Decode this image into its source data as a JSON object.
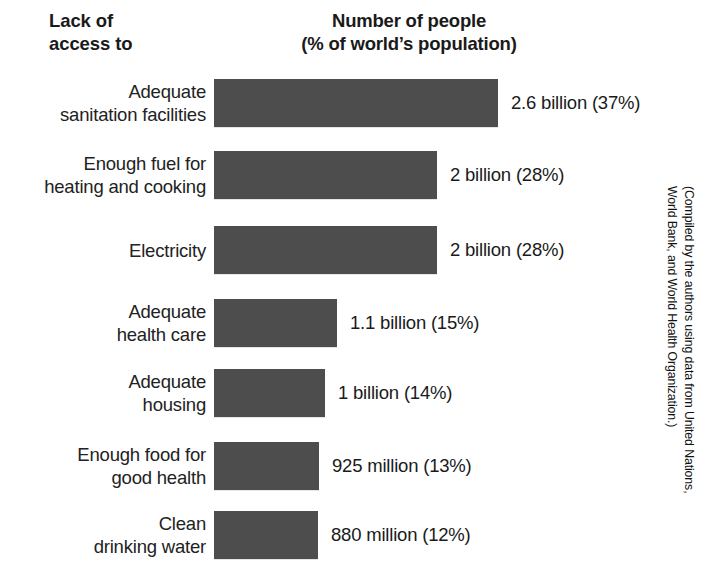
{
  "header": {
    "left_line1": "Lack of",
    "left_line2": "access to",
    "right_line1": "Number of people",
    "right_line2": "(% of world’s population)"
  },
  "credit": {
    "line1": "(Compiled by the authors using data from United Nations,",
    "line2": "World Bank, and World Health Organization.)"
  },
  "colors": {
    "bar": "#4d4d4d",
    "text": "#1a1a1a",
    "background": "#ffffff"
  },
  "chart_data": {
    "type": "bar",
    "orientation": "horizontal",
    "title": "Number of people (% of world’s population)",
    "xlabel": "",
    "ylabel": "Lack of access to",
    "grid": false,
    "legend": null,
    "xlim": [
      0,
      2.6
    ],
    "value_unit": "people",
    "categories": [
      "Adequate sanitation facilities",
      "Enough fuel for heating and cooking",
      "Electricity",
      "Adequate health care",
      "Adequate housing",
      "Enough food for good health",
      "Clean drinking water"
    ],
    "values": [
      2.6,
      2.0,
      2.0,
      1.1,
      1.0,
      0.925,
      0.88
    ],
    "percentages": [
      37,
      28,
      28,
      15,
      14,
      13,
      12
    ],
    "data_labels": [
      "2.6 billion (37%)",
      "2 billion (28%)",
      "2 billion (28%)",
      "1.1 billion (15%)",
      "1 billion (14%)",
      "925 million (13%)",
      "880 million (12%)"
    ],
    "rows": [
      {
        "label_line1": "Adequate",
        "label_line2": "sanitation facilities",
        "value_label": "2.6 billion (37%)",
        "value": 2.6,
        "percent": 37
      },
      {
        "label_line1": "Enough fuel for",
        "label_line2": "heating and cooking",
        "value_label": "2 billion (28%)",
        "value": 2.0,
        "percent": 28
      },
      {
        "label_line1": "Electricity",
        "label_line2": "",
        "value_label": "2 billion (28%)",
        "value": 2.0,
        "percent": 28
      },
      {
        "label_line1": "Adequate",
        "label_line2": "health care",
        "value_label": "1.1 billion (15%)",
        "value": 1.1,
        "percent": 15
      },
      {
        "label_line1": "Adequate",
        "label_line2": "housing",
        "value_label": "1 billion (14%)",
        "value": 1.0,
        "percent": 14
      },
      {
        "label_line1": "Enough food for",
        "label_line2": "good health",
        "value_label": "925 million (13%)",
        "value": 0.925,
        "percent": 13
      },
      {
        "label_line1": "Clean",
        "label_line2": "drinking water",
        "value_label": "880 million (12%)",
        "value": 0.88,
        "percent": 12
      }
    ]
  },
  "geometry": {
    "bar_left": 214,
    "bar_height": 48,
    "row_tops": [
      79,
      151,
      226,
      299,
      369,
      442,
      511
    ],
    "bar_rights": [
      498,
      437,
      437,
      337,
      325,
      319,
      318
    ],
    "label_gap": 13
  }
}
